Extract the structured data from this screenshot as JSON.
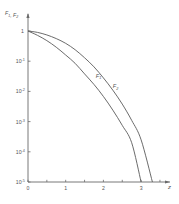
{
  "chart_data": {
    "type": "line",
    "title": "",
    "xlabel": "z",
    "ylabel": "F1, F2",
    "yscale": "log",
    "xlim": [
      0,
      3.6
    ],
    "ylim": [
      1e-05,
      1
    ],
    "x_ticks": [
      0,
      0.5,
      1,
      1.5,
      2,
      2.5,
      3,
      3.5
    ],
    "x_tick_labels": [
      {
        "value": 0,
        "label": "0"
      },
      {
        "value": 1,
        "label": "1"
      },
      {
        "value": 2,
        "label": "2"
      },
      {
        "value": 3,
        "label": "3"
      }
    ],
    "y_tick_labels": [
      {
        "value": 1,
        "label": "1",
        "exp": ""
      },
      {
        "value": 0.1,
        "label": "10",
        "exp": "-1"
      },
      {
        "value": 0.01,
        "label": "10",
        "exp": "-2"
      },
      {
        "value": 0.001,
        "label": "10",
        "exp": "-3"
      },
      {
        "value": 0.0001,
        "label": "10",
        "exp": "-4"
      },
      {
        "value": 1e-05,
        "label": "10",
        "exp": "-5"
      }
    ],
    "grid": false,
    "legend": "inline labels on curves",
    "series": [
      {
        "name": "F1",
        "label_pos": {
          "z": 1.8,
          "logF": -1.55
        },
        "points": [
          {
            "z": 0,
            "F": 1
          },
          {
            "z": 0.25,
            "F": 0.72
          },
          {
            "z": 0.5,
            "F": 0.48
          },
          {
            "z": 0.75,
            "F": 0.29
          },
          {
            "z": 1.0,
            "F": 0.16
          },
          {
            "z": 1.25,
            "F": 0.085
          },
          {
            "z": 1.5,
            "F": 0.038
          },
          {
            "z": 1.75,
            "F": 0.017
          },
          {
            "z": 2.0,
            "F": 0.0068
          },
          {
            "z": 2.25,
            "F": 0.0024
          },
          {
            "z": 2.5,
            "F": 0.00075
          },
          {
            "z": 2.75,
            "F": 0.0002
          },
          {
            "z": 3.0,
            "F": 1e-05
          }
        ]
      },
      {
        "name": "F2",
        "label_pos": {
          "z": 2.25,
          "logF": -1.9
        },
        "points": [
          {
            "z": 0,
            "F": 1
          },
          {
            "z": 0.25,
            "F": 0.9
          },
          {
            "z": 0.5,
            "F": 0.74
          },
          {
            "z": 0.75,
            "F": 0.56
          },
          {
            "z": 1.0,
            "F": 0.39
          },
          {
            "z": 1.25,
            "F": 0.24
          },
          {
            "z": 1.5,
            "F": 0.13
          },
          {
            "z": 1.75,
            "F": 0.065
          },
          {
            "z": 2.0,
            "F": 0.028
          },
          {
            "z": 2.25,
            "F": 0.011
          },
          {
            "z": 2.5,
            "F": 0.0038
          },
          {
            "z": 2.75,
            "F": 0.0011
          },
          {
            "z": 3.0,
            "F": 0.00025
          },
          {
            "z": 3.3,
            "F": 1e-05
          }
        ]
      }
    ]
  }
}
